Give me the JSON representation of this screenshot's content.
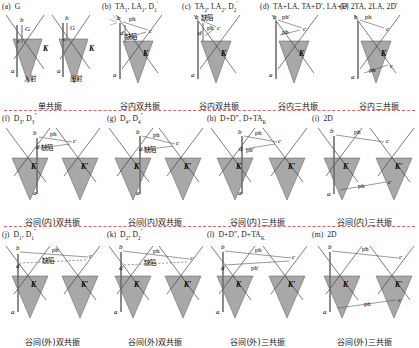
{
  "figure": {
    "type": "raman-resonance-dirac-cone-diagrams",
    "rows": 3,
    "colors": {
      "cone_fill": "#a8a8a8",
      "cone_stroke": "#555555",
      "divider": "#d34a4a",
      "arrow": "#555555",
      "vertical_transition": "#6f6f6f"
    },
    "glossary": {
      "incident": "入射",
      "scattered": "出射",
      "defect": "缺陷",
      "phonon": "ph",
      "phonon_prime": "ph'",
      "valley_K": "K",
      "valley_Kprime": "K'"
    }
  },
  "rows": [
    {
      "id": "row-1",
      "caption_group": [
        "单共振",
        "谷内双共振",
        "谷内双共振",
        "谷内三共振"
      ],
      "panels": [
        {
          "tag": "(a)",
          "title_parts": [
            {
              "t": "G"
            }
          ],
          "title_plain": "(a) G",
          "caption": "单共振",
          "sub_labels": [
            "入射",
            "出射"
          ],
          "point_labels": [
            "a",
            "b",
            "c",
            "K"
          ],
          "band_labels": [
            "G",
            "G"
          ]
        },
        {
          "tag": "(b)",
          "title_parts": [
            {
              "t": "TA"
            },
            {
              "sub": "1"
            },
            {
              "t": ", LA"
            },
            {
              "sub": "1"
            },
            {
              "t": ", D"
            },
            {
              "sub": "1"
            },
            {
              "sup": "'"
            }
          ],
          "title_plain": "(b) TA1, LA1, D1'",
          "caption": "谷内双共振",
          "point_labels": [
            "a",
            "b",
            "c",
            "d",
            "K"
          ],
          "annotations": [
            "ph",
            "缺陷"
          ]
        },
        {
          "tag": "(c)",
          "title_parts": [
            {
              "t": "TA"
            },
            {
              "sub": "2"
            },
            {
              "t": ", LA"
            },
            {
              "sub": "2"
            },
            {
              "t": ", D"
            },
            {
              "sub": "2"
            },
            {
              "sup": "'"
            }
          ],
          "title_plain": "(c) TA2, LA2, D2'",
          "caption": "谷内双共振",
          "point_labels": [
            "a",
            "b",
            "c",
            "d",
            "K"
          ],
          "annotations": [
            "ph",
            "缺陷"
          ]
        },
        {
          "tag": "(d)",
          "title_parts": [
            {
              "t": "TA+LA, TA+D', LA+D'"
            }
          ],
          "title_plain": "(d) TA+LA, TA+D', LA+D'",
          "caption": "谷内三共振",
          "point_labels": [
            "a",
            "b",
            "c",
            "K"
          ],
          "annotations": [
            "ph'",
            "ph"
          ]
        },
        {
          "tag": "(e)",
          "title_parts": [
            {
              "t": "2TA, 2LA, 2D'"
            }
          ],
          "title_plain": "(e) 2TA, 2LA, 2D'",
          "caption": "谷内三共振",
          "point_labels": [
            "a",
            "b",
            "c",
            "K"
          ],
          "annotations": [
            "ph",
            "ph"
          ]
        }
      ]
    },
    {
      "id": "row-2",
      "caption_group": [
        "谷间(内)双共振",
        "谷间(内)双共振",
        "谷间(内)三共振"
      ],
      "panels": [
        {
          "tag": "(f)",
          "title_parts": [
            {
              "t": "D"
            },
            {
              "sub": "3"
            },
            {
              "t": ", D"
            },
            {
              "sub": "3"
            },
            {
              "sup": "\""
            }
          ],
          "title_plain": "(f) D3, D3\"",
          "caption": "谷间(内)双共振",
          "point_labels": [
            "a",
            "b",
            "c",
            "d",
            "K",
            "K'"
          ],
          "annotations": [
            "ph",
            "缺陷"
          ]
        },
        {
          "tag": "(g)",
          "title_parts": [
            {
              "t": "D"
            },
            {
              "sub": "4"
            },
            {
              "t": ", D"
            },
            {
              "sub": "4"
            },
            {
              "sup": "\""
            }
          ],
          "title_plain": "(g) D4, D4\"",
          "caption": "谷间(内)双共振",
          "point_labels": [
            "a",
            "b",
            "c",
            "d",
            "K",
            "K'"
          ],
          "annotations": [
            "ph",
            "缺陷"
          ]
        },
        {
          "tag": "(h)",
          "title_parts": [
            {
              "t": "D+D\", D+TA"
            },
            {
              "sub": "K"
            }
          ],
          "title_plain": "(h) D+D\", D+TAK",
          "caption": "谷间(内)三共振",
          "point_labels": [
            "a",
            "b",
            "c",
            "d",
            "K",
            "K'"
          ],
          "annotations": [
            "ph",
            "ph'"
          ]
        },
        {
          "tag": "(i)",
          "title_parts": [
            {
              "t": "2D"
            }
          ],
          "title_plain": "(i) 2D",
          "caption": "谷间(内)三共振",
          "point_labels": [
            "a",
            "b",
            "c",
            "K",
            "K'"
          ],
          "annotations": [
            "ph",
            "ph"
          ]
        }
      ]
    },
    {
      "id": "row-3",
      "caption_group": [
        "谷间(外)双共振",
        "谷间(外)双共振",
        "谷间(外)三共振"
      ],
      "panels": [
        {
          "tag": "(j)",
          "title_parts": [
            {
              "t": "D"
            },
            {
              "sub": "1"
            },
            {
              "t": ", D"
            },
            {
              "sub": "1"
            },
            {
              "sup": "\""
            }
          ],
          "title_plain": "(j) D1, D1\"",
          "caption": "谷间(外)双共振",
          "point_labels": [
            "a",
            "b",
            "c",
            "d",
            "K",
            "K'"
          ],
          "annotations": [
            "ph",
            "缺陷"
          ]
        },
        {
          "tag": "(k)",
          "title_parts": [
            {
              "t": "D"
            },
            {
              "sub": "2"
            },
            {
              "t": ", D"
            },
            {
              "sub": "2"
            },
            {
              "sup": "\""
            }
          ],
          "title_plain": "(k) D2, D2\"",
          "caption": "谷间(外)双共振",
          "point_labels": [
            "a",
            "b",
            "c",
            "d",
            "K",
            "K'"
          ],
          "annotations": [
            "ph",
            "缺陷"
          ]
        },
        {
          "tag": "(l)",
          "title_parts": [
            {
              "t": "D+D\", D+TA"
            },
            {
              "sub": "K"
            }
          ],
          "title_plain": "(l) D+D\", D+TAK",
          "caption": "谷间(外)三共振",
          "point_labels": [
            "a",
            "b",
            "c",
            "d",
            "K",
            "K'"
          ],
          "annotations": [
            "ph",
            "ph'"
          ]
        },
        {
          "tag": "(m)",
          "title_parts": [
            {
              "t": "2D"
            }
          ],
          "title_plain": "(m) 2D",
          "caption": "谷间(外)三共振",
          "point_labels": [
            "a",
            "b",
            "c",
            "K",
            "K'"
          ],
          "annotations": [
            "ph",
            "ph"
          ]
        }
      ]
    }
  ]
}
